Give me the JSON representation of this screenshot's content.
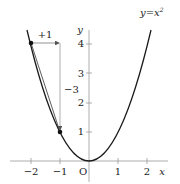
{
  "diagram": {
    "type": "function-graph",
    "function_label": "y=x²",
    "function_label_base": "y=x",
    "function_label_exp": "2",
    "axes": {
      "x_label": "x",
      "y_label": "y",
      "origin_label": "O",
      "x_ticks": [
        {
          "value": -2,
          "label": "−2"
        },
        {
          "value": -1,
          "label": "−1"
        },
        {
          "value": 1,
          "label": "1"
        },
        {
          "value": 2,
          "label": "2"
        }
      ],
      "y_ticks": [
        {
          "value": 1,
          "label": "1"
        },
        {
          "value": 2,
          "label": "2"
        },
        {
          "value": 3,
          "label": "3"
        },
        {
          "value": 4,
          "label": "4"
        }
      ]
    },
    "points": [
      {
        "x": -2,
        "y": 4
      },
      {
        "x": -1,
        "y": 1
      }
    ],
    "annotations": {
      "horizontal_change": "+1",
      "vertical_change": "−3"
    },
    "colors": {
      "curve": "#1a1a1a",
      "axes": "#888888",
      "guide": "#999999",
      "points": "#111111"
    }
  }
}
